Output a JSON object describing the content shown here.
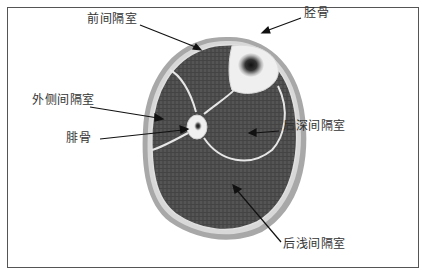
{
  "diagram": {
    "type": "anatomical cross-section",
    "labels": {
      "anterior_compartment": "前间隔室",
      "tibia": "胫骨",
      "lateral_compartment": "外侧间隔室",
      "fibula": "腓骨",
      "deep_posterior_compartment": "后深间隔室",
      "superficial_posterior_compartment": "后浅间隔室"
    },
    "colors": {
      "muscle": "#4a4a4a",
      "fascia": "#e8e8e8",
      "skin": "#a8a8a8",
      "bone": "#f0f0f0",
      "marrow": "#1a1a1a",
      "frame": "#555555",
      "text": "#333333"
    }
  }
}
